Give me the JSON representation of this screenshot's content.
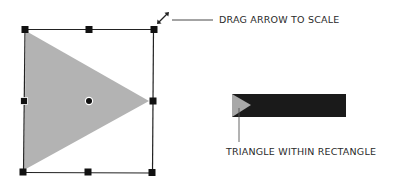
{
  "callouts": {
    "scale": "DRAG ARROW TO SCALE",
    "inner": "TRIANGLE WITHIN RECTANGLE"
  },
  "colors": {
    "triangle_fill": "#b3b3b3",
    "frame_stroke": "#222222",
    "handle": "#111111",
    "rect_fill": "#1a1a1a",
    "text": "#2a2a2a"
  },
  "icons": {
    "scale_arrow": "diagonal-double-arrow",
    "center": "center-point"
  }
}
